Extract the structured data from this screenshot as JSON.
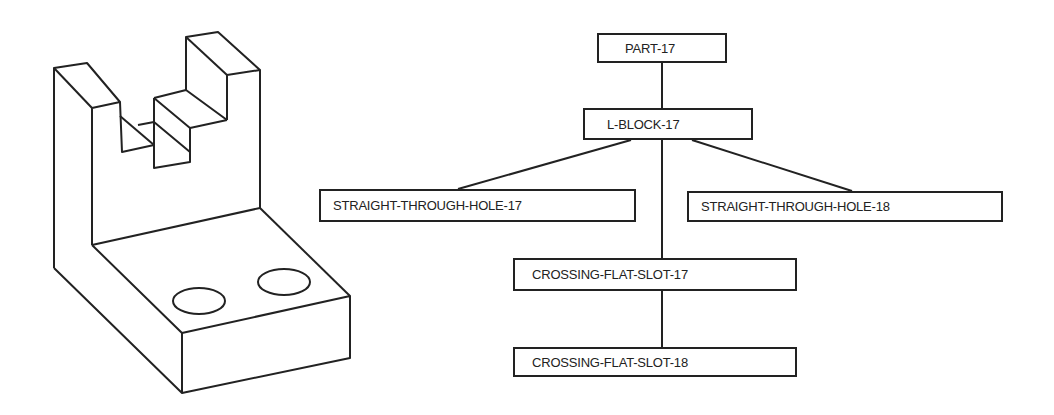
{
  "figure": {
    "part_drawing": {
      "description": "Isometric line drawing of an L-shaped block with a stepped crossing slot in the upright and two through holes in the base",
      "stroke_color": "#222222"
    },
    "tree": {
      "stroke_color": "#222222",
      "nodes": [
        {
          "id": "part",
          "label": "PART-17"
        },
        {
          "id": "lblock",
          "label": "L-BLOCK-17"
        },
        {
          "id": "sth17",
          "label": "STRAIGHT-THROUGH-HOLE-17"
        },
        {
          "id": "sth18",
          "label": "STRAIGHT-THROUGH-HOLE-18"
        },
        {
          "id": "cfs17",
          "label": "CROSSING-FLAT-SLOT-17"
        },
        {
          "id": "cfs18",
          "label": "CROSSING-FLAT-SLOT-18"
        }
      ],
      "edges": [
        [
          "PART-17",
          "L-BLOCK-17"
        ],
        [
          "L-BLOCK-17",
          "STRAIGHT-THROUGH-HOLE-17"
        ],
        [
          "L-BLOCK-17",
          "STRAIGHT-THROUGH-HOLE-18"
        ],
        [
          "L-BLOCK-17",
          "CROSSING-FLAT-SLOT-17"
        ],
        [
          "CROSSING-FLAT-SLOT-17",
          "CROSSING-FLAT-SLOT-18"
        ]
      ]
    }
  }
}
